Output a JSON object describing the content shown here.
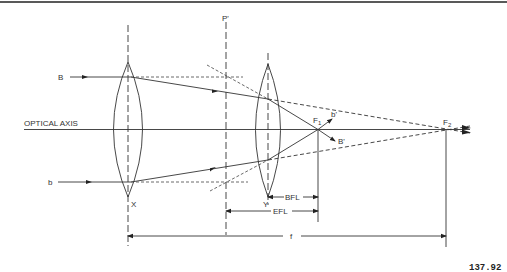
{
  "diagram": {
    "labels": {
      "ray_top_in": "B",
      "ray_bottom_in": "b",
      "principal_plane": "P'",
      "optical_axis": "OPTICAL AXIS",
      "focus_1": "F",
      "focus_1_sub": "1",
      "focus_2": "F",
      "focus_2_sub": "2",
      "ray_top_out": "B'",
      "ray_bottom_out": "b'",
      "lens_1": "X",
      "lens_2": "Y",
      "back_focal_length": "BFL",
      "effective_focal_length": "EFL",
      "focal_length": "f"
    },
    "figure_number": "137.92"
  },
  "colors": {
    "line": "#333333",
    "background": "#ffffff"
  }
}
